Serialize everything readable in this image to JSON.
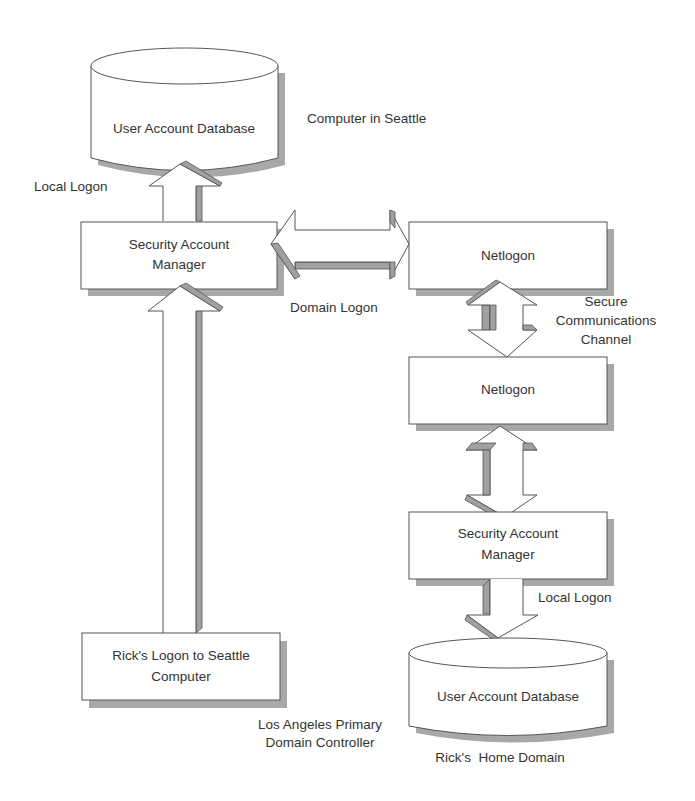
{
  "diagram": {
    "title": "Computer in Seattle",
    "nodes": {
      "seattle_user_db": {
        "label": "User Account Database"
      },
      "seattle_sam": {
        "label_line1": "Security Account",
        "label_line2": "Manager"
      },
      "ricks_logon": {
        "label_line1": "Rick's Logon to Seattle",
        "label_line2": "Computer"
      },
      "seattle_netlogon": {
        "label": "Netlogon"
      },
      "la_netlogon": {
        "label": "Netlogon"
      },
      "la_sam": {
        "label_line1": "Security Account",
        "label_line2": "Manager"
      },
      "la_user_db": {
        "label": "User Account Database"
      }
    },
    "edge_labels": {
      "local_logon_top": "Local Logon",
      "domain_logon": "Domain Logon",
      "secure_channel_line1": "Secure",
      "secure_channel_line2": "Communications",
      "secure_channel_line3": "Channel",
      "local_logon_bottom": "Local Logon"
    },
    "region_labels": {
      "computer_in_seattle": "Computer in Seattle",
      "la_pdc_line1": "Los Angeles Primary",
      "la_pdc_line2": "Domain Controller",
      "home_domain": "Rick's  Home Domain"
    },
    "colors": {
      "shape_fill": "#ffffff",
      "shape_stroke": "#555555",
      "shadow": "#a8a8a8",
      "text": "#333333"
    }
  }
}
